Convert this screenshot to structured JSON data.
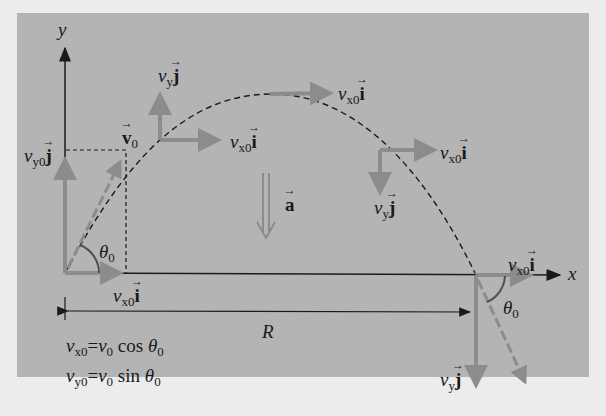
{
  "diagram": {
    "colors": {
      "background_outer": "#ececec",
      "panel": "#b4b4b4",
      "vector_arrow": "#8c8c8c",
      "axis_line": "#1a1a1a",
      "trajectory": "#1a1a1a",
      "text": "#1a1a1a"
    },
    "axes": {
      "x_label": "x",
      "y_label": "y"
    },
    "labels": {
      "v0": "v",
      "v0_sub": "0",
      "vy0j_v": "v",
      "vy0j_sub": "y0",
      "vyj_v": "v",
      "vyj_sub": "y",
      "vx0i_v": "v",
      "vx0i_sub": "x0",
      "i": "i",
      "j": "j",
      "a": "a",
      "theta": "θ",
      "theta_sub": "0",
      "range": "R"
    },
    "equations": [
      {
        "lhs_v": "v",
        "lhs_sub": "x0",
        "eq": "=",
        "rhs_v": "v",
        "rhs_sub": "0",
        "func": "cos",
        "theta": "θ",
        "theta_sub": "0"
      },
      {
        "lhs_v": "v",
        "lhs_sub": "y0",
        "eq": "=",
        "rhs_v": "v",
        "rhs_sub": "0",
        "func": "sin",
        "theta": "θ",
        "theta_sub": "0"
      }
    ]
  }
}
